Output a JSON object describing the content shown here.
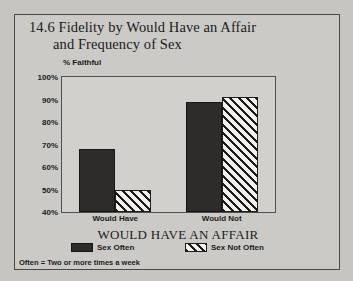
{
  "figure": {
    "title_line1": "14.6 Fidelity by Would Have an Affair",
    "title_line2": "and Frequency of Sex",
    "footnote": "Often = Two or more times a week"
  },
  "chart_data": {
    "type": "bar",
    "title": "14.6 Fidelity by Would Have an Affair and Frequency of Sex",
    "xlabel": "WOULD HAVE AN AFFAIR",
    "ylabel": "% Faithful",
    "ylim": [
      40,
      100
    ],
    "ytick_labels": [
      "100%",
      "90%",
      "80%",
      "70%",
      "60%",
      "50%",
      "40%"
    ],
    "ytick_values": [
      100,
      90,
      80,
      70,
      60,
      50,
      40
    ],
    "grid": false,
    "legend_position": "bottom",
    "categories": [
      "Would Have",
      "Would Not"
    ],
    "series": [
      {
        "name": "Sex Often",
        "values": [
          68,
          89
        ],
        "pattern": "solid",
        "color": "#2e2c2b"
      },
      {
        "name": "Sex Not Often",
        "values": [
          50,
          91
        ],
        "pattern": "diagonal-hatch",
        "color": "#f2f1ee"
      }
    ]
  }
}
